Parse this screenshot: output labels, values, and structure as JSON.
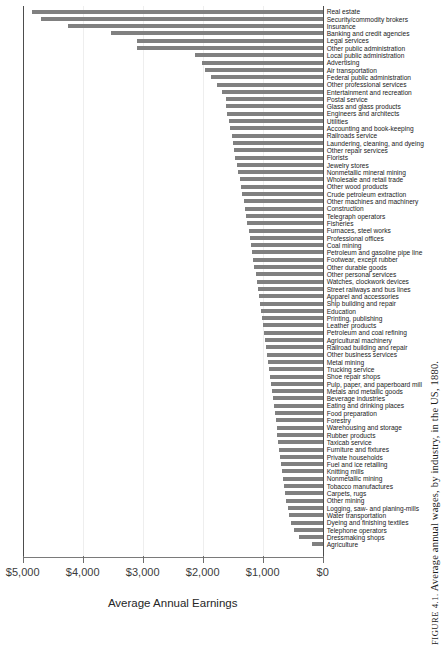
{
  "chart_data": {
    "type": "bar",
    "orientation": "horizontal",
    "title": "",
    "caption_prefix": "FIGURE 4.1.",
    "caption": "FIGURE 4.1. Average annual wages, by industry, in the US, 1880.",
    "caption_rest": " Average annual wages, by industry, in the US, 1880.",
    "xlabel": "Average Annual Earnings",
    "ylabel": "",
    "xlim": [
      5000,
      0
    ],
    "x_reversed": true,
    "grid": true,
    "grid_axis": "x",
    "legend": "none",
    "bar_color": "#808080",
    "tick_labels": [
      "$5,000",
      "$4,000",
      "$3,000",
      "$2,000",
      "$1,000",
      "$0"
    ],
    "tick_values": [
      5000,
      4000,
      3000,
      2000,
      1000,
      0
    ],
    "categories": [
      "Real estate",
      "Security/commodity brokers",
      "Insurance",
      "Banking and credit agencies",
      "Legal services",
      "Other public administration",
      "Local public administration",
      "Advertising",
      "Air transportation",
      "Federal public administration",
      "Other professional services",
      "Entertainment and recreation",
      "Postal service",
      "Glass and glass products",
      "Engineers and architects",
      "Utilities",
      "Accounting and book-keeping",
      "Railroads service",
      "Laundering, cleaning, and dyeing",
      "Other repair services",
      "Florists",
      "Jewelry stores",
      "Nonmetallic mineral mining",
      "Wholesale and retail trade",
      "Other wood products",
      "Crude petroleum extraction",
      "Other machines and machinery",
      "Construction",
      "Telegraph operators",
      "Fisheries",
      "Furnaces, steel works",
      "Professional offices",
      "Coal mining",
      "Petroleum and gasoline pipe line",
      "Footwear, except rubber",
      "Other durable goods",
      "Other personal services",
      "Watches, clockwork devices",
      "Street railways and bus lines",
      "Apparel and accessories",
      "Ship building and repair",
      "Education",
      "Printing, publishing",
      "Leather products",
      "Petroleum and coal refining",
      "Agricultural machinery",
      "Railroad building and repair",
      "Other business services",
      "Metal mining",
      "Trucking service",
      "Shoe repair shops",
      "Pulp, paper, and paperboard mill",
      "Metals and metallic goods",
      "Beverage industries",
      "Eating and drinking places",
      "Food preparation",
      "Forestry",
      "Warehousing and storage",
      "Rubber products",
      "Taxicab service",
      "Furniture and fixtures",
      "Private households",
      "Fuel and ice retailing",
      "Knitting mills",
      "Nonmetallic mining",
      "Tobacco manufactures",
      "Carpets, rugs",
      "Other mining",
      "Logging, saw- and planing-mills",
      "Water transportation",
      "Dyeing and finishing textiles",
      "Telephone operators",
      "Dressmaking shops",
      "Agriculture"
    ],
    "values": [
      4850,
      4700,
      4250,
      3525,
      3100,
      3090,
      2125,
      2020,
      1970,
      1855,
      1755,
      1680,
      1620,
      1605,
      1590,
      1565,
      1540,
      1520,
      1500,
      1480,
      1460,
      1430,
      1410,
      1385,
      1360,
      1340,
      1320,
      1300,
      1280,
      1255,
      1230,
      1215,
      1195,
      1175,
      1160,
      1140,
      1120,
      1100,
      1080,
      1060,
      1045,
      1025,
      1005,
      990,
      975,
      955,
      940,
      925,
      910,
      890,
      875,
      860,
      845,
      830,
      815,
      800,
      785,
      770,
      755,
      740,
      725,
      710,
      695,
      680,
      665,
      650,
      630,
      610,
      585,
      560,
      525,
      480,
      400,
      180
    ]
  }
}
